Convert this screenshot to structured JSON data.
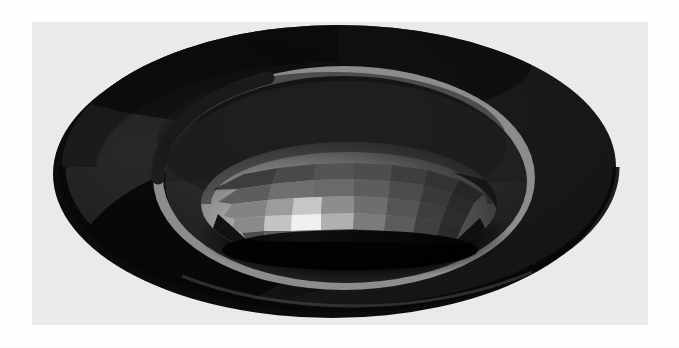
{
  "scene": {
    "title": "3D Torus with Inner Faceted Sphere",
    "renderer_style": "flat-shaded grayscale raster",
    "background_color": "#ececed",
    "page_color": "#ffffff",
    "panel": {
      "x": 32,
      "y": 22,
      "width": 616,
      "height": 303
    }
  },
  "objects": [
    {
      "name": "torus",
      "label": "Torus",
      "center": {
        "x": 307,
        "y": 145
      },
      "outer_radius_x": 277,
      "outer_radius_y": 145,
      "tube_band_width": 9,
      "colors": {
        "top_body": "#1b1b1b",
        "outer_shadow": "#0b0b0b",
        "left_face": "#232323",
        "inner_wall": "#2b2b2b",
        "rim_highlight": "#8d8d8d",
        "silhouette": "#070707"
      }
    },
    {
      "name": "inner-sphere",
      "label": "Faceted Sphere",
      "center": {
        "x": 317,
        "y": 182
      },
      "radius_x": 148,
      "radius_y": 62,
      "facet_columns": 14,
      "facet_rows": 6,
      "colors": {
        "specular": "#f2f2f2",
        "bright": "#c9c9c9",
        "mid": "#8f8f8f",
        "dim": "#5a5a5a",
        "dark": "#2e2e2e",
        "shadow": "#101010"
      }
    },
    {
      "name": "cast-shadow",
      "label": "Cast Shadow",
      "color": "#060606"
    }
  ],
  "lighting": {
    "key_light_direction": "upper-left",
    "specular_highlight": {
      "x": 297,
      "y": 215,
      "color": "#f2f2f2"
    }
  },
  "palette": {
    "background": "#ececed",
    "near_black": "#0a0a0a",
    "dark_gray": "#1d1d1d",
    "mid_dark": "#2c2c2c",
    "band_gray": "#8d8d8d",
    "light_gray": "#c9c9c9",
    "white": "#f2f2f2"
  }
}
